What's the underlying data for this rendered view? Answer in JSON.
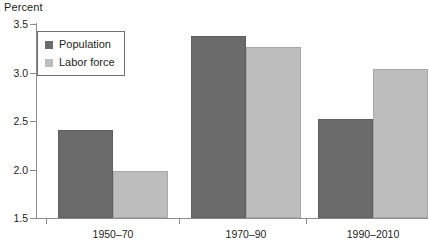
{
  "chart_data": {
    "type": "bar",
    "title": "",
    "ylabel": "Percent",
    "xlabel": "",
    "categories": [
      "1950–70",
      "1970–90",
      "1990–2010"
    ],
    "series": [
      {
        "name": "Population",
        "values": [
          2.41,
          3.38,
          2.52
        ],
        "color": "#6b6b6b"
      },
      {
        "name": "Labor force",
        "values": [
          1.98,
          3.26,
          3.04
        ],
        "color": "#bdbdbd"
      }
    ],
    "ylim": [
      1.5,
      3.5
    ],
    "ytick_labels": [
      "1.5",
      "2.0",
      "2.5",
      "3.0",
      "3.5"
    ],
    "ytick_values": [
      1.5,
      2.0,
      2.5,
      3.0,
      3.5
    ],
    "grid": false,
    "legend_position": "top-left"
  },
  "legend": {
    "entries": [
      {
        "label": "Population"
      },
      {
        "label": "Labor force"
      }
    ]
  }
}
